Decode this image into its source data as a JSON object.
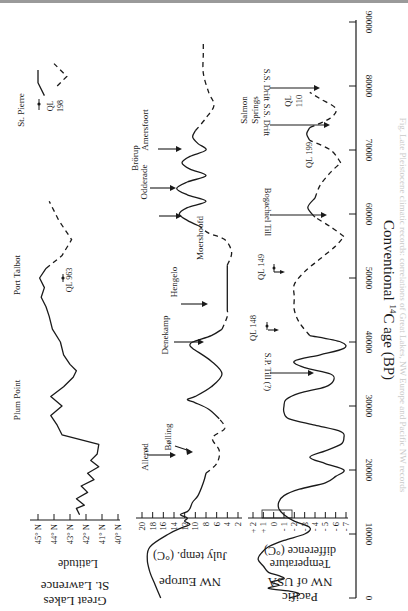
{
  "figure": {
    "orientation": "rotated 90 degrees clockwise",
    "x_axis_label": "Conventional 14C age (BP)",
    "x_axis_label_parts": {
      "pre": "Conventional ",
      "sup": "14",
      "post": "C age (BP)"
    },
    "x_ticks": [
      "0",
      "10000",
      "20000",
      "30000",
      "40000",
      "50000",
      "60000",
      "70000",
      "80000",
      "90000"
    ]
  },
  "panels": {
    "great_lakes": {
      "region_label_1": "Great Lakes",
      "region_label_2": "St. Lawrence",
      "axis_label": "Latitude",
      "ticks": [
        "45° N",
        "44° N",
        "43° N",
        "42° N",
        "41° N",
        "40° N"
      ],
      "annotations": {
        "plum_point": "Plum Point",
        "port_talbot": "Port Talbot",
        "ql963": "QL 963",
        "st_pierre": "St. Pierre",
        "ql198_a": "QL",
        "ql198_b": "198"
      }
    },
    "nw_europe": {
      "region_label": "NW Europe",
      "axis_label": "July temp. (°C)",
      "ticks": [
        "20",
        "18",
        "16",
        "14",
        "12",
        "10",
        "8",
        "6",
        "4",
        "2"
      ],
      "annotations": {
        "allerod": "Allerød",
        "bolling": "Bølling",
        "denekamp": "Denekamp",
        "hengelo": "Hengelo",
        "moershoofd": "Moershoofd",
        "odderade": "Odderade",
        "brorup": "Brörup",
        "amersfoort": "Amersfoort"
      }
    },
    "pacific_nw": {
      "region_label_1": "Pacific",
      "region_label_2": "NW of USA",
      "axis_label_1": "Temperature",
      "axis_label_2": "difference (°C)",
      "ticks": [
        "+ 2",
        "+ 1",
        "0",
        "- 1",
        "- 2",
        "- 3",
        "- 4",
        "- 5",
        "- 6",
        "- 7"
      ],
      "annotations": {
        "sp_till": "S.P. Till (?)",
        "ql148": "QL 148",
        "ql149": "QL 149",
        "bogachiel": "Bogachiel Till",
        "ql199": "QL 199",
        "ss_drift_1": "S.S. Drift",
        "ql110_a": "QL",
        "ql110_b": "110",
        "ss_drift_2": "S.S. Drift",
        "salmon_1": "Salmon",
        "salmon_2": "Springs"
      }
    }
  },
  "caption_bleed": "Fig. Late Pleistocene climatic records: correlations of Great Lakes, NW Europe and Pacific NW records",
  "chart_data": [
    {
      "type": "line",
      "title": "Great Lakes / St. Lawrence",
      "xlabel": "Conventional 14C age (BP)",
      "ylabel": "Latitude",
      "xlim": [
        0,
        90000
      ],
      "ylim": [
        "40° N",
        "45° N"
      ],
      "y_ticks": [
        "45° N",
        "44° N",
        "43° N",
        "42° N",
        "41° N",
        "40° N"
      ],
      "series": [
        {
          "name": "ice margin latitude (solid)",
          "x": [
            13000,
            14000,
            14500,
            15500,
            16500,
            17500,
            18500,
            19500,
            20500,
            21500,
            22500,
            24000,
            25500,
            27000,
            28500,
            30000,
            31500,
            33000,
            34500,
            35500,
            36500,
            38000,
            40000,
            42000,
            44000,
            45500,
            47000,
            48500,
            50000,
            51500
          ],
          "y": [
            42.4,
            42.6,
            42.1,
            42.6,
            41.9,
            42.3,
            41.5,
            41.9,
            41.2,
            41.7,
            41.3,
            41.2,
            43.5,
            43.8,
            44.2,
            43.5,
            44.2,
            43.4,
            42.8,
            42.6,
            43.0,
            43.4,
            43.6,
            44.1,
            44.3,
            44.5,
            44.8,
            44.6,
            44.9,
            44.5
          ]
        },
        {
          "name": "ice margin latitude (dashed, inferred)",
          "x": [
            51500,
            53500,
            56000,
            59000,
            62000
          ],
          "y": [
            44.5,
            43.5,
            42.9,
            43.7,
            44.3
          ]
        },
        {
          "name": "St. Pierre (solid)",
          "x": [
            78500,
            80500,
            82500
          ],
          "y": [
            44.6,
            45.0,
            45.0
          ]
        },
        {
          "name": "St. Pierre (dashed)",
          "x": [
            80000,
            81500,
            83500
          ],
          "y": [
            43.8,
            43.2,
            44.0
          ]
        }
      ],
      "annotations": [
        {
          "text": "Plum Point",
          "x": 30000
        },
        {
          "text": "Port Talbot",
          "x": 47000
        },
        {
          "text": "QL 963",
          "x": 47500
        },
        {
          "text": "St. Pierre",
          "x": 81000
        },
        {
          "text": "QL 198",
          "x": 81000
        }
      ]
    },
    {
      "type": "line",
      "title": "NW Europe",
      "xlabel": "Conventional 14C age (BP)",
      "ylabel": "July temp. (°C)",
      "xlim": [
        0,
        90000
      ],
      "ylim": [
        2,
        20
      ],
      "y_ticks": [
        20,
        18,
        16,
        14,
        12,
        10,
        8,
        6,
        4,
        2
      ],
      "series": [
        {
          "name": "July temperature (solid)",
          "x": [
            0,
            2000,
            4000,
            6000,
            8000,
            10000,
            11000,
            11500,
            12000,
            12500,
            13000,
            13500,
            14000,
            15000,
            16000,
            18000,
            19500
          ],
          "y": [
            16.5,
            17.5,
            18.5,
            19.0,
            18.5,
            15.0,
            12.5,
            11.0,
            12.0,
            11.5,
            12.8,
            11.5,
            11.0,
            10.5,
            9.5,
            8.5,
            8.0
          ]
        },
        {
          "name": "July temperature (dashed)",
          "x": [
            19500,
            21000,
            23000,
            25000,
            26500,
            28000
          ],
          "y": [
            8.0,
            6.0,
            5.5,
            6.8,
            4.5,
            5.5
          ]
        },
        {
          "name": "July temperature (solid)",
          "x": [
            28000,
            29500,
            30500,
            31000,
            31500,
            33000,
            35000,
            37000,
            39000,
            39500,
            40000,
            41000,
            42000
          ],
          "y": [
            5.5,
            7.5,
            10.0,
            11.5,
            10.0,
            7.0,
            5.0,
            7.0,
            10.5,
            11.0,
            10.5,
            7.0,
            5.0
          ]
        },
        {
          "name": "July temperature (dashed)",
          "x": [
            42000,
            44000,
            45000
          ],
          "y": [
            5.0,
            4.0,
            4.0
          ]
        },
        {
          "name": "Moershoofd (solid)",
          "x": [
            45000,
            50000,
            52000
          ],
          "y": [
            4.0,
            4.0,
            4.0
          ]
        },
        {
          "name": "July temperature (dashed)",
          "x": [
            52000,
            54000,
            56000,
            57000,
            58000
          ],
          "y": [
            4.0,
            3.2,
            4.5,
            7.5,
            9.0
          ]
        },
        {
          "name": "July temperature (solid)",
          "x": [
            58000,
            59000,
            60000,
            61000,
            62000,
            63000,
            64000,
            65000,
            66000,
            67000,
            68000,
            69000,
            70000,
            71000,
            72000,
            73000
          ],
          "y": [
            9.0,
            11.5,
            13.0,
            11.5,
            8.0,
            11.5,
            13.5,
            11.5,
            8.0,
            11.0,
            12.5,
            11.0,
            8.0,
            9.5,
            10.5,
            10.0
          ]
        },
        {
          "name": "July temperature (dashed)",
          "x": [
            73000,
            75000,
            77000,
            79000,
            82000,
            85000,
            87000
          ],
          "y": [
            10.0,
            8.0,
            6.5,
            7.5,
            8.5,
            8.5,
            8.5
          ]
        }
      ],
      "annotations": [
        {
          "text": "Allerød",
          "x": 11500
        },
        {
          "text": "Bølling",
          "x": 13000
        },
        {
          "text": "Denekamp",
          "x": 31000
        },
        {
          "text": "Hengelo",
          "x": 39500
        },
        {
          "text": "Moershoofd",
          "x": 48000
        },
        {
          "text": "Odderade",
          "x": 60000
        },
        {
          "text": "Brörup",
          "x": 64000
        },
        {
          "text": "Amersfoort",
          "x": 68500
        }
      ]
    },
    {
      "type": "line",
      "title": "Pacific NW of USA",
      "xlabel": "Conventional 14C age (BP)",
      "ylabel": "Temperature difference (°C)",
      "xlim": [
        0,
        90000
      ],
      "ylim": [
        -7,
        2
      ],
      "y_ticks": [
        2,
        1,
        0,
        -1,
        -2,
        -3,
        -4,
        -5,
        -6,
        -7
      ],
      "series": [
        {
          "name": "Temperature difference (solid)",
          "x": [
            0,
            500,
            1000,
            1500,
            2000,
            2500,
            3000,
            3500,
            4000,
            5000,
            6000,
            7000,
            8000,
            9000,
            10000,
            11000,
            12000,
            13000,
            14000,
            15000,
            16000,
            17000,
            18000,
            19000,
            20000,
            21000,
            22000,
            23000,
            24000,
            25000,
            26000,
            27000,
            28000,
            29000,
            30000,
            31000,
            32000,
            33000,
            34000,
            35000,
            36000,
            37000,
            38000,
            39000,
            40000,
            41000
          ],
          "y": [
            -1.5,
            -2.5,
            -1.8,
            0.5,
            -0.5,
            0.2,
            -1.0,
            -0.5,
            0.5,
            1.0,
            1.5,
            1.2,
            0.5,
            -1.0,
            -3.0,
            -3.5,
            -2.0,
            -1.0,
            -0.5,
            -0.5,
            -1.0,
            -2.5,
            -5.0,
            -6.0,
            -6.8,
            -5.0,
            -3.5,
            -5.0,
            -6.5,
            -6.8,
            -6.5,
            -4.0,
            -1.5,
            -1.0,
            -1.0,
            -1.2,
            -2.5,
            -5.0,
            -5.8,
            -5.5,
            -3.0,
            -2.0,
            -4.5,
            -6.8,
            -6.5,
            -3.5
          ]
        },
        {
          "name": "Temperature difference (dashed)",
          "x": [
            41000,
            43000,
            45000,
            47000,
            49000,
            51000,
            53000,
            55000,
            56500
          ],
          "y": [
            -3.5,
            -2.5,
            -2.0,
            -2.0,
            -2.0,
            -3.0,
            -4.5,
            -6.0,
            -6.8
          ]
        },
        {
          "name": "Temperature difference (dashed)",
          "x": [
            56500,
            58000,
            59500
          ],
          "y": [
            -6.8,
            -5.5,
            -4.0
          ]
        },
        {
          "name": "QL 199 (solid)",
          "x": [
            59500,
            61000,
            62500
          ],
          "y": [
            -4.0,
            -3.3,
            -4.0
          ]
        },
        {
          "name": "Temperature difference (dashed)",
          "x": [
            62500,
            64500,
            66500,
            68000
          ],
          "y": [
            -4.0,
            -4.5,
            -5.5,
            -6.5
          ]
        },
        {
          "name": "Temperature difference (dashed)",
          "x": [
            68000,
            70000,
            71500
          ],
          "y": [
            -6.5,
            -5.5,
            -3.5
          ]
        },
        {
          "name": "QL 110 (solid)",
          "x": [
            71500,
            72500,
            73500
          ],
          "y": [
            -3.5,
            -3.2,
            -3.5
          ]
        },
        {
          "name": "Temperature difference (dashed)",
          "x": [
            73500,
            75000,
            76500,
            78000,
            79000
          ],
          "y": [
            -3.5,
            -5.5,
            -6.0,
            -4.5,
            -3.5
          ]
        }
      ],
      "annotations": [
        {
          "text": "S.P. Till (?)",
          "x": 35000
        },
        {
          "text": "QL 148",
          "x": 35000
        },
        {
          "text": "QL 149",
          "x": 45000
        },
        {
          "text": "Bogachiel Till",
          "x": 56500
        },
        {
          "text": "QL 199",
          "x": 61000
        },
        {
          "text": "S.S. Drift",
          "x": 68000
        },
        {
          "text": "QL 110",
          "x": 72500
        },
        {
          "text": "S.S. Drift",
          "x": 75500
        },
        {
          "text": "Salmon Springs",
          "x": 72500
        }
      ]
    }
  ]
}
